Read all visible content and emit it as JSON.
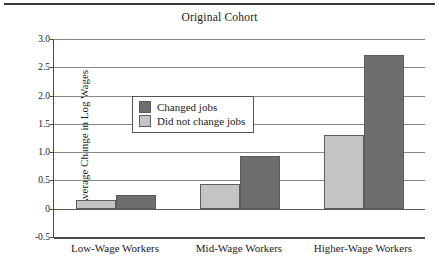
{
  "figure": {
    "top_rule_color": "#3a3a3a",
    "background": "#ffffff"
  },
  "chart_data": {
    "type": "bar",
    "title": "Original Cohort",
    "xlabel": "",
    "ylabel": "Average Change in Log Wages",
    "categories": [
      "Low-Wage Workers",
      "Mid-Wage Workers",
      "Higher-Wage Workers"
    ],
    "series": [
      {
        "name": "Did not change jobs",
        "color": "#c4c4c4",
        "values": [
          0.16,
          0.44,
          1.3
        ]
      },
      {
        "name": "Changed jobs",
        "color": "#6e6e6e",
        "values": [
          0.25,
          0.94,
          2.71
        ]
      }
    ],
    "ylim": [
      -0.5,
      3.0
    ],
    "yticks": [
      3.0,
      2.5,
      2.0,
      1.5,
      1.0,
      0.5,
      0,
      -0.5
    ],
    "ytick_labels": [
      "3.0",
      "2.5",
      "2.0",
      "1.5",
      "1.0",
      "0.5",
      "0",
      "-0.5"
    ],
    "grid": true,
    "legend_position": "upper-left-inside",
    "legend_entries": [
      "Changed jobs",
      "Did not change jobs"
    ],
    "bar_order_in_group": [
      "Did not change jobs",
      "Changed jobs"
    ]
  },
  "colors": {
    "dark_bar": "#6e6e6e",
    "light_bar": "#c4c4c4",
    "bar_outline": "#5c5c5c",
    "gridline": "#888888",
    "axis": "#4a4a4a",
    "text": "#1a1a1a"
  }
}
